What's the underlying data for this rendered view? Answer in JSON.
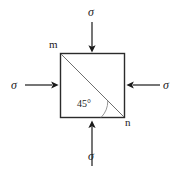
{
  "figure": {
    "background_color": "#ffffff",
    "line_color": "#2b2b2b",
    "diagonal_color": "#6e6e6e",
    "arrow_color": "#1a1a1a",
    "text_color": "#1a1a1a"
  },
  "labels": {
    "sigma_top": "σ",
    "sigma_left": "σ",
    "sigma_right": "σ",
    "sigma_bottom": "σ",
    "corner_m": "m",
    "corner_n": "n",
    "angle": "45°"
  },
  "geometry": {
    "square": {
      "x": 60,
      "y": 53,
      "width": 65,
      "height": 65
    },
    "diagonal": {
      "x1": 60,
      "y1": 53,
      "x2": 125,
      "y2": 118
    },
    "angle_value": 45,
    "angle_unit": "degrees",
    "arrows": [
      {
        "name": "top",
        "direction": "down",
        "x1": 92,
        "y1": 22,
        "x2": 92,
        "y2": 52
      },
      {
        "name": "left",
        "direction": "right",
        "x1": 25,
        "y1": 85,
        "x2": 58,
        "y2": 85
      },
      {
        "name": "right",
        "direction": "left",
        "x1": 160,
        "y1": 85,
        "x2": 127,
        "y2": 85
      },
      {
        "name": "bottom",
        "direction": "up",
        "x1": 92,
        "y1": 166,
        "x2": 92,
        "y2": 121
      }
    ]
  }
}
